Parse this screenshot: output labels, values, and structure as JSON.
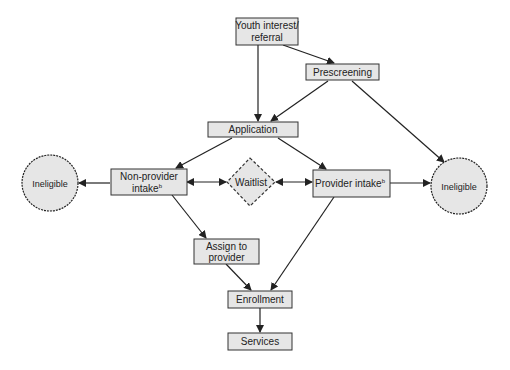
{
  "diagram": {
    "type": "flowchart",
    "colors": {
      "node_fill": "#e6e6e6",
      "node_stroke": "#333333",
      "edge": "#222222",
      "background": "#ffffff"
    },
    "nodes": {
      "youth": {
        "lines": [
          "Youth interest/",
          "referral"
        ],
        "shape": "rect"
      },
      "prescreening": {
        "lines": [
          "Prescreening"
        ],
        "shape": "rect"
      },
      "application": {
        "lines": [
          "Application"
        ],
        "shape": "rect"
      },
      "nonprovider": {
        "lines": [
          "Non-provider",
          "intake"
        ],
        "sup": "b",
        "shape": "rect"
      },
      "waitlist": {
        "lines": [
          "Waitlist"
        ],
        "shape": "diamond"
      },
      "provider": {
        "lines": [
          "Provider intake"
        ],
        "sup": "b",
        "shape": "rect"
      },
      "ineligible_left": {
        "lines": [
          "Ineligible"
        ],
        "shape": "circle"
      },
      "ineligible_right": {
        "lines": [
          "Ineligible"
        ],
        "shape": "circle"
      },
      "assign": {
        "lines": [
          "Assign to",
          "provider"
        ],
        "shape": "rect"
      },
      "enrollment": {
        "lines": [
          "Enrollment"
        ],
        "shape": "rect"
      },
      "services": {
        "lines": [
          "Services"
        ],
        "shape": "rect"
      }
    },
    "edges": [
      {
        "from": "youth",
        "to": "prescreening"
      },
      {
        "from": "youth",
        "to": "application"
      },
      {
        "from": "prescreening",
        "to": "application"
      },
      {
        "from": "prescreening",
        "to": "ineligible_right"
      },
      {
        "from": "application",
        "to": "nonprovider"
      },
      {
        "from": "application",
        "to": "provider"
      },
      {
        "from": "nonprovider",
        "to": "ineligible_left"
      },
      {
        "from": "nonprovider",
        "to": "waitlist",
        "bidirectional": true
      },
      {
        "from": "waitlist",
        "to": "provider",
        "bidirectional": true
      },
      {
        "from": "provider",
        "to": "ineligible_right"
      },
      {
        "from": "nonprovider",
        "to": "assign"
      },
      {
        "from": "assign",
        "to": "enrollment"
      },
      {
        "from": "provider",
        "to": "enrollment"
      },
      {
        "from": "enrollment",
        "to": "services"
      }
    ]
  }
}
